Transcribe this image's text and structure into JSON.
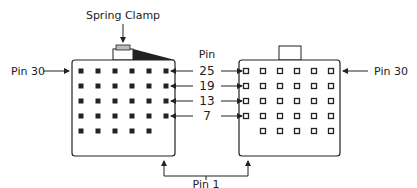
{
  "diagram": {
    "labels": {
      "spring_clamp": "Spring Clamp",
      "pin_header": "Pin",
      "pin30_left": "Pin 30",
      "pin30_right": "Pin 30",
      "pin1": "Pin 1"
    },
    "row_pin_numbers": [
      "25",
      "19",
      "13",
      "7"
    ],
    "left_connector": {
      "rows": 5,
      "cols": 6,
      "last_row_pins": 5,
      "pin_style": "filled"
    },
    "right_connector": {
      "rows": 5,
      "cols": 6,
      "last_row_pins": 5,
      "pin_style": "hollow"
    },
    "colors": {
      "line": "#222222",
      "clamp_fill": "#bbbbbb"
    }
  }
}
